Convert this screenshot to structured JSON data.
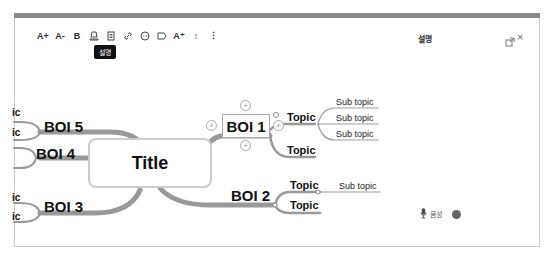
{
  "toolbar": {
    "items": [
      {
        "name": "font-increase",
        "label": "A+"
      },
      {
        "name": "font-decrease",
        "label": "A-"
      },
      {
        "name": "bold",
        "label": "B"
      },
      {
        "name": "highlight",
        "label": ""
      },
      {
        "name": "note",
        "label": ""
      },
      {
        "name": "link",
        "label": ""
      },
      {
        "name": "comment",
        "label": ""
      },
      {
        "name": "label",
        "label": ""
      },
      {
        "name": "superscript",
        "label": "A⁺"
      },
      {
        "name": "spacing",
        "label": "↕"
      },
      {
        "name": "more",
        "label": "⋮"
      }
    ],
    "tooltip": "설명"
  },
  "panel": {
    "title": "설명",
    "voice_label": "음성",
    "colors": {
      "record": "#666666"
    }
  },
  "mindmap": {
    "title": "Title",
    "branches": [
      {
        "label": "BOI 1",
        "topics": [
          {
            "label": "Topic",
            "subtopics": [
              "Sub topic",
              "Sub topic",
              "Sub topic"
            ]
          },
          {
            "label": "Topic",
            "subtopics": []
          }
        ]
      },
      {
        "label": "BOI 2",
        "topics": [
          {
            "label": "Topic",
            "subtopics": [
              "Sub topic"
            ]
          },
          {
            "label": "Topic",
            "subtopics": []
          }
        ]
      },
      {
        "label": "BOI 3",
        "topics": [
          {
            "label": "ic"
          },
          {
            "label": "ic"
          }
        ]
      },
      {
        "label": "BOI 4",
        "topics": []
      },
      {
        "label": "BOI 5",
        "topics": [
          {
            "label": "ic"
          },
          {
            "label": "ic"
          }
        ]
      }
    ]
  }
}
